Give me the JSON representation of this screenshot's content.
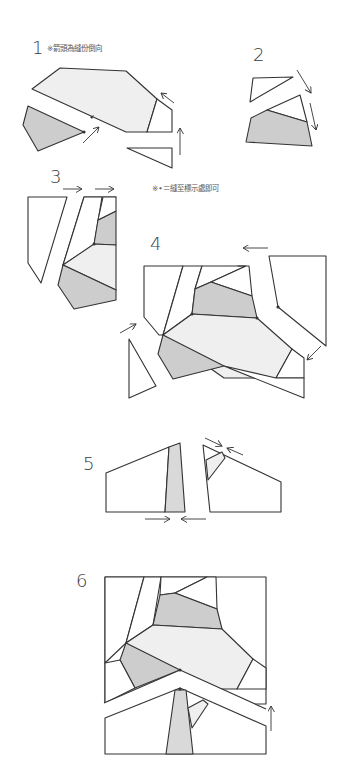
{
  "steps": [
    {
      "number": "1",
      "note": "※箭頭為縫份倒向"
    },
    {
      "number": "2"
    },
    {
      "number": "3",
      "note": "※•＝縫至標示處即可"
    },
    {
      "number": "4"
    },
    {
      "number": "5"
    },
    {
      "number": "6"
    }
  ],
  "colors": {
    "light_fabric": "#efefef",
    "dark_fabric": "#cdcdcd",
    "line": "#333333",
    "background": "#ffffff"
  }
}
